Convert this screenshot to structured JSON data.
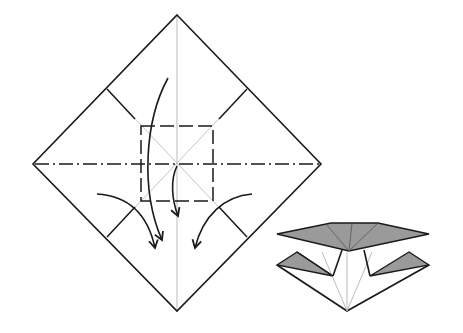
{
  "diagram": {
    "type": "origami-folding-step",
    "colors": {
      "background": "#ffffff",
      "line": "#1a1a1a",
      "crease_light": "#bbbbbb",
      "shaded_face": "#9a9a9a"
    },
    "main_figure": {
      "shape": "square-paper-diamond",
      "lines": [
        "valley-fold-dashed",
        "mountain-fold-dash-dot",
        "precrease-light"
      ],
      "arrows": 4
    },
    "result_figure": {
      "shape": "collapsed-base-preview"
    }
  }
}
